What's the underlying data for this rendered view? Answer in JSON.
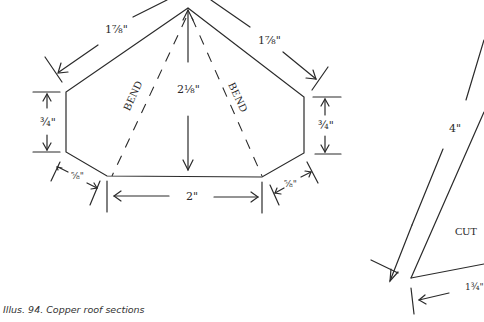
{
  "figure": {
    "caption": "Illus. 94. Copper roof sections",
    "colors": {
      "ink": "#2a2a2a",
      "background": "#ffffff"
    }
  },
  "left_section": {
    "labels": {
      "top_left_edge": "1⅞\"",
      "top_right_edge": "1⅞\"",
      "height": "2⅛\"",
      "left_side": "¾\"",
      "right_side": "¾\"",
      "bottom_left_corner": "⅝\"",
      "bottom_right_corner": "⅝\"",
      "bottom": "2\""
    },
    "bend_labels": [
      "BEND",
      "BEND"
    ]
  },
  "right_section": {
    "labels": {
      "long_edge": "4\"",
      "bottom_edge": "1¾\"",
      "cut_label": "CUT"
    }
  }
}
